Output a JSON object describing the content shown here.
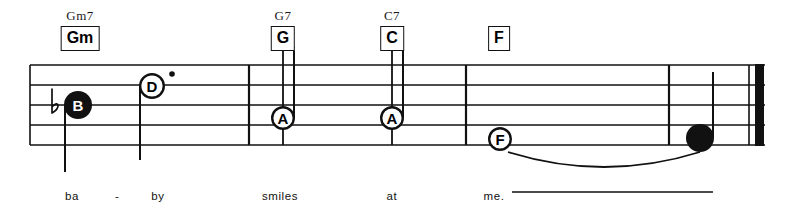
{
  "document": {
    "kind": "lead-sheet-music-excerpt",
    "ink_color": "#111111",
    "paper_color": "#ffffff"
  },
  "staff": {
    "left": 30,
    "right": 765,
    "line_ys": [
      65,
      85,
      105,
      125,
      145
    ],
    "line_width": 1.4
  },
  "chords": [
    {
      "id": "chord-gm",
      "superscript": "Gm7",
      "boxed": "Gm",
      "x": 80,
      "sup_y": 8,
      "box_y": 26
    },
    {
      "id": "chord-g",
      "superscript": "G7",
      "boxed": "G",
      "x": 283,
      "sup_y": 8,
      "box_y": 26
    },
    {
      "id": "chord-c",
      "superscript": "C7",
      "boxed": "C",
      "x": 392,
      "sup_y": 8,
      "box_y": 26
    },
    {
      "id": "chord-f",
      "superscript": "",
      "boxed": "F",
      "x": 499,
      "sup_y": 8,
      "box_y": 26
    }
  ],
  "barlines": [
    {
      "id": "barline-1",
      "x": 249
    },
    {
      "id": "barline-2",
      "x": 466
    },
    {
      "id": "barline-3",
      "x": 669
    }
  ],
  "final_barline": {
    "x": 755,
    "thin_x": 749,
    "thickness": 9
  },
  "accidentals": [
    {
      "id": "flat-before-b",
      "glyph": "flat",
      "x": 52,
      "y": 105
    }
  ],
  "notes": [
    {
      "id": "note-b-flat",
      "letter": "B",
      "head": "filled",
      "letter_color": "#ffffff",
      "x": 78,
      "y": 105,
      "radius": 14,
      "stem": "down",
      "stem_from_y": 105,
      "stem_to_y": 172,
      "dotted": false
    },
    {
      "id": "note-d",
      "letter": "D",
      "head": "open",
      "letter_color": "#000000",
      "x": 152,
      "y": 86,
      "radius": 13,
      "stem": "down",
      "stem_from_y": 86,
      "stem_to_y": 160,
      "dotted": true,
      "dot_x": 172,
      "dot_y": 74
    },
    {
      "id": "note-a-1",
      "letter": "A",
      "head": "open",
      "letter_color": "#000000",
      "x": 283,
      "y": 118,
      "radius": 12,
      "stem": "up",
      "stem_from_y": 118,
      "stem_to_y": 46,
      "dotted": false
    },
    {
      "id": "note-a-2",
      "letter": "A",
      "head": "open",
      "letter_color": "#000000",
      "x": 392,
      "y": 118,
      "radius": 12,
      "stem": "up",
      "stem_from_y": 118,
      "stem_to_y": 46,
      "dotted": false
    },
    {
      "id": "note-f",
      "letter": "F",
      "head": "open",
      "letter_color": "#000000",
      "x": 500,
      "y": 139,
      "radius": 12,
      "stem": "none",
      "dotted": false
    },
    {
      "id": "note-final",
      "letter": "",
      "head": "filled",
      "letter_color": "#000000",
      "x": 700,
      "y": 138,
      "radius": 14,
      "stem": "up",
      "stem_from_y": 138,
      "stem_to_y": 72,
      "dotted": false
    }
  ],
  "tie": {
    "id": "tie-f-to-final",
    "from_x": 508,
    "to_x": 700,
    "start_y": 152,
    "peak_y": 172
  },
  "lyrics": [
    {
      "id": "lyric-ba",
      "text": "ba",
      "x": 72,
      "y": 190
    },
    {
      "id": "lyric-dash",
      "text": "-",
      "x": 117,
      "y": 190
    },
    {
      "id": "lyric-by",
      "text": "by",
      "x": 158,
      "y": 190
    },
    {
      "id": "lyric-smiles",
      "text": "smiles",
      "x": 280,
      "y": 190
    },
    {
      "id": "lyric-at",
      "text": "at",
      "x": 392,
      "y": 190
    },
    {
      "id": "lyric-me",
      "text": "me.",
      "x": 494,
      "y": 190
    }
  ],
  "lyric_extension": {
    "id": "melisma-line",
    "from_x": 512,
    "to_x": 713,
    "y": 192
  }
}
